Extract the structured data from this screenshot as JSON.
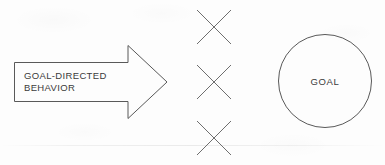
{
  "figure": {
    "type": "concept-diagram",
    "background_color": "#fdfdfd",
    "stroke_color": "#595959",
    "text_color": "#3b3b3b"
  },
  "arrow": {
    "name": "goal-directed-behavior-arrow",
    "label_line1": "GOAL-DIRECTED",
    "label_line2": "BEHAVIOR",
    "direction": "right",
    "shaft": {
      "x": 14,
      "y": 62,
      "width": 114,
      "height": 39
    },
    "head": {
      "tip_x": 167,
      "tip_y": 82,
      "top_y": 45,
      "bottom_y": 118,
      "base_x": 128
    }
  },
  "barriers": {
    "name": "barrier-marks",
    "symbol": "x-mark",
    "count": 3,
    "size": 35,
    "center_x": 214,
    "items": [
      {
        "label": "barrier-1",
        "center_y": 27
      },
      {
        "label": "barrier-2",
        "center_y": 82
      },
      {
        "label": "barrier-3",
        "center_y": 138
      }
    ]
  },
  "goal": {
    "name": "goal-circle",
    "label": "GOAL",
    "center_x": 325,
    "center_y": 81,
    "radius": 47
  }
}
